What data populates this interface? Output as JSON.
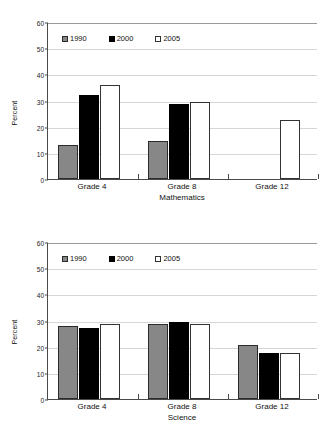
{
  "chart_data": [
    {
      "type": "bar",
      "title": "",
      "xlabel": "Mathematics",
      "ylabel": "Percent",
      "ylim": [
        0,
        60
      ],
      "yticks": [
        0,
        10,
        20,
        30,
        40,
        50,
        60
      ],
      "grid": true,
      "legend_position": "top-left-inside",
      "categories": [
        "Grade 4",
        "Grade 8",
        "Grade 12"
      ],
      "series": [
        {
          "name": "1990",
          "color": "#878787",
          "values": [
            13,
            14.5,
            null
          ]
        },
        {
          "name": "2000",
          "color": "#000000",
          "values": [
            32,
            28.5,
            null
          ]
        },
        {
          "name": "2005",
          "color": "#ffffff",
          "values": [
            36,
            29.5,
            22.5
          ]
        }
      ]
    },
    {
      "type": "bar",
      "title": "",
      "xlabel": "Science",
      "ylabel": "Percent",
      "ylim": [
        0,
        60
      ],
      "yticks": [
        0,
        10,
        20,
        30,
        40,
        50,
        60
      ],
      "grid": true,
      "legend_position": "top-left-inside",
      "categories": [
        "Grade 4",
        "Grade 8",
        "Grade 12"
      ],
      "series": [
        {
          "name": "1990",
          "color": "#878787",
          "values": [
            28,
            28.5,
            20.5
          ]
        },
        {
          "name": "2000",
          "color": "#000000",
          "values": [
            27,
            29.5,
            17.5
          ]
        },
        {
          "name": "2005",
          "color": "#ffffff",
          "values": [
            28.5,
            28.5,
            17.5
          ]
        }
      ]
    }
  ],
  "charts": [
    {
      "ylabel": "Percent",
      "xtitle": "Mathematics",
      "yticks": [
        "60",
        "50",
        "40",
        "30",
        "20",
        "10",
        "0"
      ],
      "xticks": [
        "Grade 4",
        "Grade 8",
        "Grade 12"
      ],
      "legend": [
        "1990",
        "2000",
        "2005"
      ]
    },
    {
      "ylabel": "Percent",
      "xtitle": "Science",
      "yticks": [
        "60",
        "50",
        "40",
        "30",
        "20",
        "10",
        "0"
      ],
      "xticks": [
        "Grade 4",
        "Grade 8",
        "Grade 12"
      ],
      "legend": [
        "1990",
        "2000",
        "2005"
      ]
    }
  ]
}
